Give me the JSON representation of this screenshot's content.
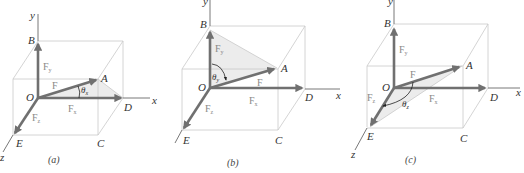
{
  "figure": {
    "panels": [
      {
        "id": "a",
        "caption": "(a)",
        "axes": {
          "x": "x",
          "y": "y",
          "z": "z"
        },
        "points": {
          "O": "O",
          "A": "A",
          "B": "B",
          "C": "C",
          "D": "D",
          "E": "E"
        },
        "vectors": {
          "F": "F",
          "Fx": "F",
          "Fx_sub": "x",
          "Fy": "F",
          "Fy_sub": "y",
          "Fz": "F",
          "Fz_sub": "z"
        },
        "angle": {
          "symbol": "θ",
          "sub": "x"
        },
        "shaded_triangle": "O-A-D"
      },
      {
        "id": "b",
        "caption": "(b)",
        "axes": {
          "x": "x",
          "y": "y",
          "z": "z"
        },
        "points": {
          "O": "O",
          "A": "A",
          "B": "B",
          "C": "C",
          "D": "D",
          "E": "E"
        },
        "vectors": {
          "F": "F",
          "Fx": "F",
          "Fx_sub": "x",
          "Fy": "F",
          "Fy_sub": "y",
          "Fz": "F",
          "Fz_sub": "z"
        },
        "angle": {
          "symbol": "θ",
          "sub": "y"
        },
        "shaded_triangle": "O-A-B"
      },
      {
        "id": "c",
        "caption": "(c)",
        "axes": {
          "x": "x",
          "y": "y",
          "z": "z"
        },
        "points": {
          "O": "O",
          "A": "A",
          "B": "B",
          "C": "C",
          "D": "D",
          "E": "E"
        },
        "vectors": {
          "F": "F",
          "Fx": "F",
          "Fx_sub": "x",
          "Fy": "F",
          "Fy_sub": "y",
          "Fz": "F",
          "Fz_sub": "z"
        },
        "angle": {
          "symbol": "θ",
          "sub": "z"
        },
        "shaded_triangle": "O-A-E"
      }
    ],
    "colors": {
      "vector": "#707070",
      "box": "#c9c9c9",
      "shade": "#ececec",
      "axis": "#555555"
    }
  }
}
